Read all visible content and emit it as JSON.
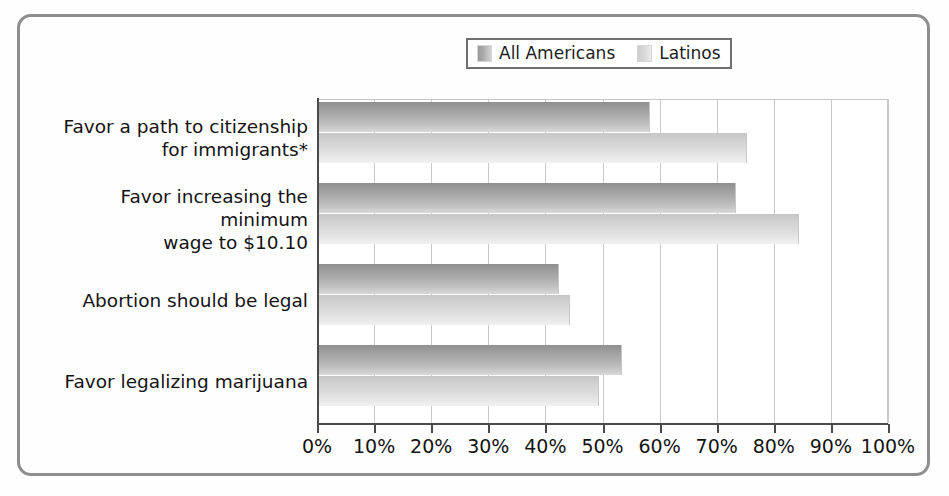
{
  "chart_data": {
    "type": "bar",
    "orientation": "horizontal",
    "title": "",
    "xlabel": "",
    "ylabel": "",
    "xlim": [
      0,
      100
    ],
    "xtick_labels": [
      "0%",
      "10%",
      "20%",
      "30%",
      "40%",
      "50%",
      "60%",
      "70%",
      "80%",
      "90%",
      "100%"
    ],
    "xticks": [
      0,
      10,
      20,
      30,
      40,
      50,
      60,
      70,
      80,
      90,
      100
    ],
    "grid": "vertical",
    "legend_position": "top-center",
    "categories": [
      "Favor a path to citizenship\nfor immigrants*",
      "Favor increasing the minimum\nwage to $10.10",
      "Abortion should be legal",
      "Favor legalizing marijuana"
    ],
    "category_lines": [
      [
        "Favor a path to citizenship",
        "for immigrants*"
      ],
      [
        "Favor increasing the minimum",
        "wage to $10.10"
      ],
      [
        "Abortion should be legal"
      ],
      [
        "Favor legalizing marijuana"
      ]
    ],
    "series": [
      {
        "name": "All Americans",
        "color": "#a3a3a3",
        "values": [
          58,
          73,
          42,
          53
        ]
      },
      {
        "name": "Latinos",
        "color": "#d8d8d8",
        "values": [
          75,
          84,
          44,
          49
        ]
      }
    ],
    "footnote": "*"
  },
  "legend": {
    "entries": [
      {
        "label": "All Americans",
        "swatch": "all-americans-swatch"
      },
      {
        "label": "Latinos",
        "swatch": "latinos-swatch"
      }
    ]
  },
  "colors": {
    "frame_border": "#8e8e8e",
    "axis": "#4a4a4a",
    "gridline": "#c9c9c9",
    "text": "#141414",
    "background": "#ffffff",
    "series_all_americans": "#a3a3a3",
    "series_latinos": "#d8d8d8"
  }
}
